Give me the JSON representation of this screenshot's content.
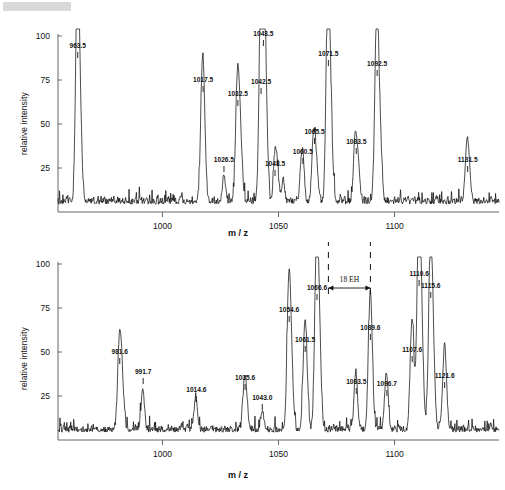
{
  "figure": {
    "redaction_note": "",
    "background": "#ffffff",
    "trace_color": "#101010",
    "axis_color": "#555555"
  },
  "chart_data": [
    {
      "panel": "top",
      "type": "line",
      "title": "",
      "xlabel": "m / z",
      "ylabel": "relative intensity",
      "xlim": [
        955,
        1145
      ],
      "ylim": [
        0,
        100
      ],
      "xticks": [
        1000,
        1050,
        1100
      ],
      "yticks": [
        25,
        50,
        75,
        100
      ],
      "grid": false,
      "baseline_noise_level": 8,
      "annotations": [],
      "labeled_peaks": [
        {
          "mz": "963.5",
          "x": 963.5,
          "y": 85
        },
        {
          "mz": "1017.5",
          "x": 1017.5,
          "y": 55
        },
        {
          "mz": "1026.5",
          "x": 1026.5,
          "y": 15
        },
        {
          "mz": "1032.5",
          "x": 1032.5,
          "y": 48
        },
        {
          "mz": "1042.5",
          "x": 1042.5,
          "y": 57
        },
        {
          "mz": "1043.5",
          "x": 1043.5,
          "y": 90
        },
        {
          "mz": "1048.5",
          "x": 1048.5,
          "y": 25
        },
        {
          "mz": "1060.5",
          "x": 1060.5,
          "y": 20
        },
        {
          "mz": "1065.5",
          "x": 1065.5,
          "y": 27
        },
        {
          "mz": "1071.5",
          "x": 1071.5,
          "y": 79
        },
        {
          "mz": "1083.5",
          "x": 1083.5,
          "y": 24
        },
        {
          "mz": "1092.5",
          "x": 1092.5,
          "y": 69
        },
        {
          "mz": "1131.5",
          "x": 1131.5,
          "y": 22
        }
      ]
    },
    {
      "panel": "bottom",
      "type": "line",
      "title": "",
      "xlabel": "m / z",
      "ylabel": "relative intensity",
      "xlim": [
        955,
        1145
      ],
      "ylim": [
        0,
        100
      ],
      "xticks": [
        1000,
        1050,
        1100
      ],
      "yticks": [
        25,
        50,
        75,
        100
      ],
      "grid": false,
      "baseline_noise_level": 8,
      "annotations": [
        {
          "label": "18 EH",
          "from_mz": 1071.5,
          "to_mz": 1089.6,
          "type": "span-arrow"
        }
      ],
      "labeled_peaks": [
        {
          "mz": "981.6",
          "x": 981.6,
          "y": 30
        },
        {
          "mz": "991.7",
          "x": 991.7,
          "y": 15
        },
        {
          "mz": "1014.6",
          "x": 1014.6,
          "y": 12
        },
        {
          "mz": "1035.6",
          "x": 1035.6,
          "y": 17
        },
        {
          "mz": "1043.0",
          "x": 1043.0,
          "y": 11
        },
        {
          "mz": "1054.6",
          "x": 1054.6,
          "y": 50
        },
        {
          "mz": "1061.5",
          "x": 1061.5,
          "y": 35
        },
        {
          "mz": "1066.6",
          "x": 1066.6,
          "y": 66
        },
        {
          "mz": "1083.5",
          "x": 1083.5,
          "y": 22
        },
        {
          "mz": "1089.6",
          "x": 1089.6,
          "y": 42
        },
        {
          "mz": "1096.7",
          "x": 1096.7,
          "y": 21
        },
        {
          "mz": "1107.6",
          "x": 1107.6,
          "y": 33
        },
        {
          "mz": "1110.6",
          "x": 1110.6,
          "y": 72
        },
        {
          "mz": "1115.6",
          "x": 1115.6,
          "y": 61
        },
        {
          "mz": "1121.6",
          "x": 1121.6,
          "y": 26
        }
      ]
    }
  ],
  "axes": {
    "ylabel": "relative intensity",
    "xlabel": "m / z",
    "yticks": [
      "100",
      "75",
      "50",
      "25"
    ],
    "xticks": [
      "1000",
      "1050",
      "1100"
    ]
  },
  "annotation": {
    "label": "18 EH"
  }
}
